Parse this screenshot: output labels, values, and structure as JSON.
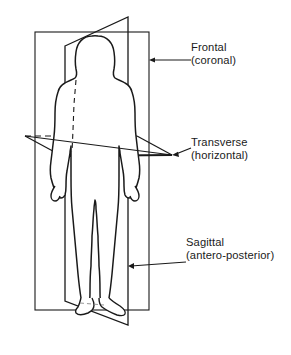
{
  "figure": {
    "type": "anatomical-planes-diagram",
    "background_color": "#ffffff",
    "line_color": "#1a1a1a",
    "text_color": "#1a1a1a"
  },
  "labels": [
    {
      "id": "frontal",
      "name": "Frontal",
      "alias": "(coronal)",
      "plane": "frontal-plane",
      "leader_from_x": 191,
      "leader_from_y": 60,
      "leader_to_x": 149,
      "leader_to_y": 60
    },
    {
      "id": "transverse",
      "name": "Transverse",
      "alias": "(horizontal)",
      "plane": "transverse-plane",
      "leader_from_x": 191,
      "leader_from_y": 150,
      "leader_to_x": 172,
      "leader_to_y": 155
    },
    {
      "id": "sagittal",
      "name": "Sagittal",
      "alias": "(antero-posterior)",
      "plane": "sagittal-plane",
      "leader_from_x": 186,
      "leader_from_y": 262,
      "leader_to_x": 128,
      "leader_to_y": 266
    }
  ],
  "caption": {
    "partial_text": ""
  }
}
